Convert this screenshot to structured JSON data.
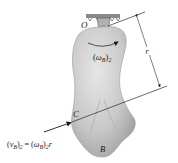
{
  "figure": {
    "pivot_label": "O",
    "point_c_label": "C",
    "point_b_label": "B",
    "radius_label": "r",
    "angular_velocity_label": {
      "symbol": "ω",
      "subscript": "B",
      "outer_subscript": "2"
    },
    "velocity_equation": {
      "lhs_symbol": "v",
      "lhs_subscript": "B",
      "lhs_outer_subscript": "2",
      "equals": "=",
      "rhs_symbol": "ω",
      "rhs_subscript": "B",
      "rhs_outer_subscript": "2",
      "rhs_factor": "r"
    },
    "colors": {
      "body_fill": "#c9c9c9",
      "body_shadow": "#a8a8a8",
      "support": "#8a8a8a",
      "line": "#2a2a2a"
    }
  }
}
